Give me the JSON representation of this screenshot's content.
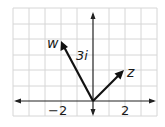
{
  "diagram": {
    "type": "complex-plane-vectors",
    "grid": {
      "x_min": -5,
      "x_max": 4,
      "y_min": -1,
      "y_max": 6,
      "spacing_px": 15.6
    },
    "origin_px": [
      93,
      101
    ],
    "axes": {
      "x_arrows": "both",
      "y_arrows": "both"
    },
    "tick_labels": [
      {
        "text": "−2",
        "value": -2
      },
      {
        "text": "2",
        "value": 2
      }
    ],
    "vectors": [
      {
        "name": "w",
        "label": "w",
        "to": [
          -2,
          4
        ]
      },
      {
        "name": "z",
        "label": "z",
        "to": [
          2,
          2
        ]
      }
    ],
    "annotations": [
      {
        "text": "3i",
        "near": "w-vector"
      }
    ],
    "colors": {
      "grid": "#d6d6d6",
      "axis": "#222222",
      "vector": "#111111"
    }
  }
}
